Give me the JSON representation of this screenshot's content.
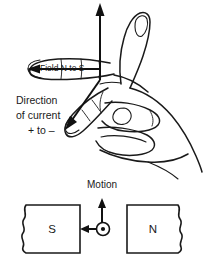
{
  "figure": {
    "title_visible": false,
    "background_color": "#ffffff",
    "ink_color": "#1a1a1a",
    "labels": {
      "field": "Field N to S",
      "current_line1": "Direction",
      "current_line2": "of current",
      "current_line3": "+ to –",
      "motion": "Motion",
      "south_pole": "S",
      "north_pole": "N"
    },
    "icons": {
      "thumb_arrow": "up-arrow-icon",
      "field_arrow": "left-arrow-icon",
      "current_arrow": "down-left-arrow-icon",
      "motion_arrow": "up-arrow-icon",
      "field_arrow_lower": "left-arrow-icon",
      "current_out_of_page": "circled-dot-icon"
    },
    "magnets": [
      {
        "pole": "S",
        "position": "left"
      },
      {
        "pole": "N",
        "position": "right"
      }
    ]
  }
}
